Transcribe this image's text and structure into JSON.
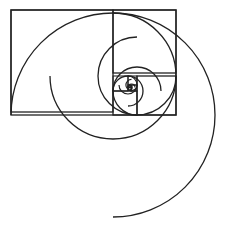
{
  "diagram": {
    "stroke_color": "#222222",
    "background": "#ffffff",
    "stroke_width": 1.3,
    "outer_rectangle": {
      "x": 11,
      "y": 10,
      "width": 165,
      "height": 105
    },
    "squares": [
      {
        "x": 11,
        "y": 10,
        "size": 102
      },
      {
        "x": 113,
        "y": 10,
        "size": 63
      },
      {
        "x": 137,
        "y": 76,
        "size": 39
      },
      {
        "x": 113,
        "y": 91,
        "size": 24
      },
      {
        "x": 113,
        "y": 76,
        "size": 15
      },
      {
        "x": 128,
        "y": 76,
        "size": 9
      },
      {
        "x": 131,
        "y": 85,
        "size": 6
      },
      {
        "x": 128,
        "y": 87,
        "size": 3.5
      },
      {
        "x": 128,
        "y": 85,
        "size": 2.2
      }
    ],
    "arcs": [
      {
        "cx": 113,
        "cy": 115,
        "r": 102,
        "start_deg": 180,
        "sweep_deg": 270
      },
      {
        "cx": 113,
        "cy": 76,
        "r": 63,
        "start_deg": 270,
        "sweep_deg": 270
      },
      {
        "cx": 137,
        "cy": 76,
        "r": 39,
        "start_deg": 0,
        "sweep_deg": 270
      },
      {
        "cx": 137,
        "cy": 91,
        "r": 24,
        "start_deg": 90,
        "sweep_deg": 270
      },
      {
        "cx": 128,
        "cy": 91,
        "r": 15,
        "start_deg": 180,
        "sweep_deg": 270
      },
      {
        "cx": 128,
        "cy": 85,
        "r": 9,
        "start_deg": 270,
        "sweep_deg": 270
      },
      {
        "cx": 131.5,
        "cy": 85,
        "r": 5.6,
        "start_deg": 0,
        "sweep_deg": 270
      },
      {
        "cx": 131.5,
        "cy": 87.5,
        "r": 3.5,
        "start_deg": 90,
        "sweep_deg": 270
      },
      {
        "cx": 130,
        "cy": 87.5,
        "r": 2.2,
        "start_deg": 180,
        "sweep_deg": 270
      },
      {
        "cx": 130,
        "cy": 86.5,
        "r": 1.3,
        "start_deg": 270,
        "sweep_deg": 270
      }
    ]
  }
}
